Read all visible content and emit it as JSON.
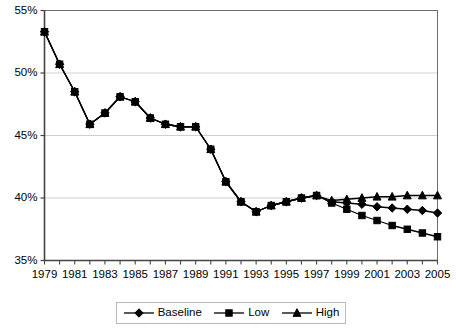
{
  "chart_data": {
    "type": "line",
    "title": "",
    "xlabel": "",
    "ylabel": "",
    "x": [
      1979,
      1980,
      1981,
      1982,
      1983,
      1984,
      1985,
      1986,
      1987,
      1988,
      1989,
      1990,
      1991,
      1992,
      1993,
      1994,
      1995,
      1996,
      1997,
      1998,
      1999,
      2000,
      2001,
      2002,
      2003,
      2004,
      2005
    ],
    "xlim": [
      1979,
      2005
    ],
    "ylim": [
      35,
      55
    ],
    "ytick_labels": [
      "35%",
      "40%",
      "45%",
      "50%",
      "55%"
    ],
    "ytick_values": [
      35,
      40,
      45,
      50,
      55
    ],
    "xtick_labels": [
      "1979",
      "1981",
      "1983",
      "1985",
      "1987",
      "1989",
      "1991",
      "1993",
      "1995",
      "1997",
      "1999",
      "2001",
      "2003",
      "2005"
    ],
    "xtick_values": [
      1979,
      1981,
      1983,
      1985,
      1987,
      1989,
      1991,
      1993,
      1995,
      1997,
      1999,
      2001,
      2003,
      2005
    ],
    "grid": true,
    "grid_axis": "y",
    "legend_position": "bottom",
    "series": [
      {
        "name": "Baseline",
        "marker": "diamond",
        "color": "#000000",
        "values": [
          53.3,
          50.7,
          48.5,
          45.9,
          46.8,
          48.1,
          47.7,
          46.4,
          45.9,
          45.7,
          45.7,
          43.9,
          41.3,
          39.7,
          38.9,
          39.4,
          39.7,
          40.0,
          40.2,
          39.7,
          39.6,
          39.5,
          39.3,
          39.2,
          39.1,
          39.0,
          38.8
        ]
      },
      {
        "name": "Low",
        "marker": "square",
        "color": "#000000",
        "values": [
          53.3,
          50.7,
          48.5,
          45.9,
          46.8,
          48.1,
          47.7,
          46.4,
          45.9,
          45.7,
          45.7,
          43.9,
          41.3,
          39.7,
          38.9,
          39.4,
          39.7,
          40.0,
          40.2,
          39.6,
          39.1,
          38.6,
          38.2,
          37.8,
          37.5,
          37.2,
          36.9
        ]
      },
      {
        "name": "High",
        "marker": "triangle",
        "color": "#000000",
        "values": [
          53.3,
          50.7,
          48.5,
          45.9,
          46.8,
          48.1,
          47.7,
          46.4,
          45.9,
          45.7,
          45.7,
          43.9,
          41.3,
          39.7,
          38.9,
          39.4,
          39.7,
          40.0,
          40.2,
          39.8,
          39.9,
          40.0,
          40.1,
          40.1,
          40.2,
          40.2,
          40.2
        ]
      }
    ]
  },
  "legend": {
    "items": [
      {
        "label": "Baseline",
        "marker": "diamond"
      },
      {
        "label": "Low",
        "marker": "square"
      },
      {
        "label": "High",
        "marker": "triangle"
      }
    ]
  },
  "axes": {
    "plot_border_color": "#6e6e6e",
    "grid_color": "#cfcfcf",
    "series_color": "#000000"
  }
}
